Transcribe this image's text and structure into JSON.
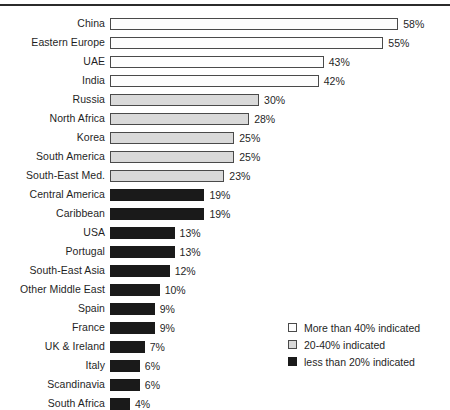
{
  "chart_data": {
    "type": "bar",
    "orientation": "horizontal",
    "title": "",
    "xlabel": "",
    "ylabel": "",
    "xlim": [
      0,
      58
    ],
    "grid": false,
    "legend_position": "bottom-right",
    "value_suffix": "%",
    "categories": [
      "China",
      "Eastern Europe",
      "UAE",
      "India",
      "Russia",
      "North Africa",
      "Korea",
      "South America",
      "South-East Med.",
      "Central America",
      "Caribbean",
      "USA",
      "Portugal",
      "South-East Asia",
      "Other Middle East",
      "Spain",
      "France",
      "UK & Ireland",
      "Italy",
      "Scandinavia",
      "South Africa"
    ],
    "values": [
      58,
      55,
      43,
      42,
      30,
      28,
      25,
      25,
      23,
      19,
      19,
      13,
      13,
      12,
      10,
      9,
      9,
      7,
      6,
      6,
      4
    ],
    "value_labels": [
      "58%",
      "55%",
      "43%",
      "42%",
      "30%",
      "28%",
      "25%",
      "25%",
      "23%",
      "19%",
      "19%",
      "13%",
      "13%",
      "12%",
      "10%",
      "9%",
      "9%",
      "7%",
      "6%",
      "6%",
      "4%"
    ],
    "styles": [
      "high",
      "high",
      "high",
      "high",
      "mid",
      "mid",
      "mid",
      "mid",
      "mid",
      "low",
      "low",
      "low",
      "low",
      "low",
      "low",
      "low",
      "low",
      "low",
      "low",
      "low",
      "low"
    ],
    "legend": [
      {
        "key": "high",
        "label": "More than 40% indicated",
        "color": "#fdfdfd"
      },
      {
        "key": "mid",
        "label": "20-40% indicated",
        "color": "#d9d9d9"
      },
      {
        "key": "low",
        "label": "less than 20% indicated",
        "color": "#1a1a1a"
      }
    ]
  },
  "colors": {
    "background": "#ffffff",
    "text": "#1f1f1f",
    "rule": "#2b2b2b",
    "bar_border": "#4a4a4a",
    "bar_high": "#fdfdfd",
    "bar_mid": "#d9d9d9",
    "bar_low": "#1a1a1a"
  }
}
